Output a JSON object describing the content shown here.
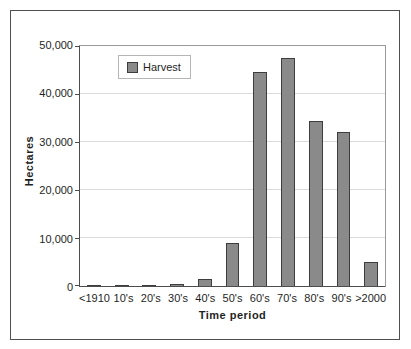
{
  "chart_data": {
    "type": "bar",
    "title": "",
    "series_name": "Harvest",
    "categories": [
      "<1910",
      "10's",
      "20's",
      "30's",
      "40's",
      "50's",
      "60's",
      "70's",
      "80's",
      "90's",
      ">2000"
    ],
    "values": [
      50,
      200,
      300,
      400,
      1400,
      9000,
      44500,
      47500,
      34400,
      32000,
      5000
    ],
    "xlabel": "Time period",
    "ylabel": "Hectares",
    "ylim": [
      0,
      50000
    ],
    "yticks": [
      0,
      10000,
      20000,
      30000,
      40000,
      50000
    ],
    "ytick_labels": [
      "0",
      "10,000",
      "20,000",
      "30,000",
      "40,000",
      "50,000"
    ],
    "legend_position": "inside-top-left",
    "grid": "horizontal",
    "colors": {
      "bar_fill": "#8a8a8a",
      "bar_border": "#3d3d3d",
      "gridline": "#dcdcdc",
      "plot_border": "#9a9a9a",
      "axis_line": "#4d4d4d",
      "chart_border": "#4f4f4f",
      "legend_border": "#b5b5b5",
      "text": "#1f1f1f",
      "background": "#ffffff"
    }
  }
}
